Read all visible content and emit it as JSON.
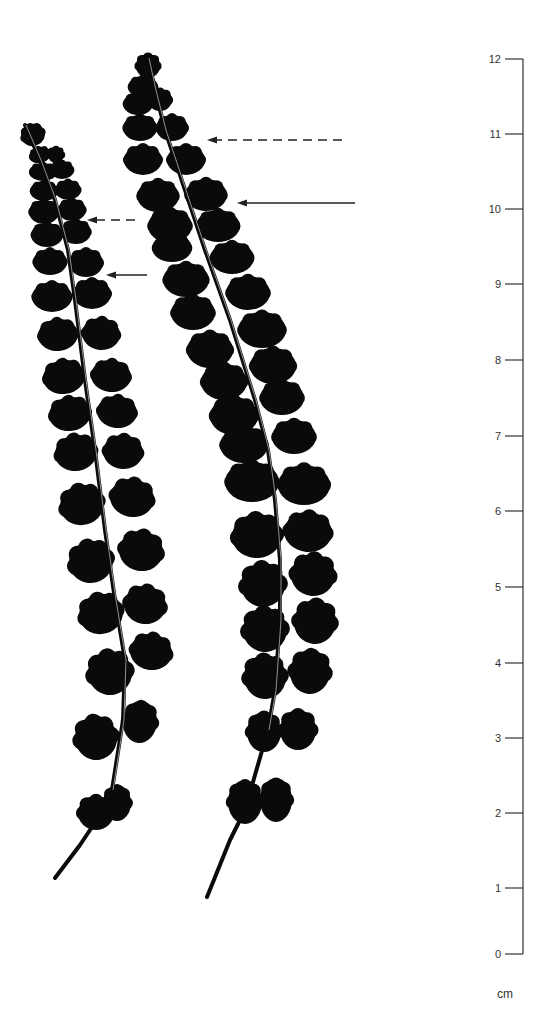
{
  "figure": {
    "background": "#ffffff",
    "ink_color": "#0a0a0a"
  },
  "scale": {
    "unit": "cm",
    "line_x": 523,
    "tick_length": 12,
    "color": "#333333",
    "ticks": [
      {
        "value": "12",
        "y": 59
      },
      {
        "value": "11",
        "y": 134
      },
      {
        "value": "10",
        "y": 209
      },
      {
        "value": "9",
        "y": 284
      },
      {
        "value": "8",
        "y": 360
      },
      {
        "value": "7",
        "y": 436
      },
      {
        "value": "6",
        "y": 511
      },
      {
        "value": "5",
        "y": 587
      },
      {
        "value": "4",
        "y": 663
      },
      {
        "value": "3",
        "y": 738
      },
      {
        "value": "2",
        "y": 813
      },
      {
        "value": "1",
        "y": 888
      },
      {
        "value": "0",
        "y": 954
      }
    ],
    "unit_label_pos": {
      "x": 497,
      "y": 998
    }
  },
  "arrows": [
    {
      "id": "left-fern-dashed",
      "style": "dashed",
      "x1": 135,
      "x2": 87,
      "y": 220
    },
    {
      "id": "left-fern-solid",
      "style": "solid",
      "x1": 147,
      "x2": 106,
      "y": 275
    },
    {
      "id": "right-fern-dashed",
      "style": "dashed",
      "x1": 342,
      "x2": 207,
      "y": 140
    },
    {
      "id": "right-fern-solid",
      "style": "solid",
      "x1": 355,
      "x2": 237,
      "y": 203
    }
  ],
  "ferns": [
    {
      "id": "left-fern",
      "rachis": [
        [
          25,
          125
        ],
        [
          40,
          160
        ],
        [
          55,
          200
        ],
        [
          68,
          250
        ],
        [
          75,
          300
        ],
        [
          85,
          380
        ],
        [
          95,
          450
        ],
        [
          105,
          530
        ],
        [
          115,
          600
        ],
        [
          125,
          660
        ],
        [
          123,
          720
        ],
        [
          112,
          790
        ],
        [
          100,
          815
        ],
        [
          80,
          845
        ],
        [
          55,
          878
        ]
      ],
      "rachis_width": 4,
      "pinnae": [
        {
          "cx": 33,
          "cy": 135,
          "rx": 12,
          "ry": 11,
          "rot": -20
        },
        {
          "cx": 40,
          "cy": 155,
          "rx": 11,
          "ry": 8,
          "rot": -15
        },
        {
          "cx": 56,
          "cy": 155,
          "rx": 8,
          "ry": 8,
          "rot": 0
        },
        {
          "cx": 43,
          "cy": 172,
          "rx": 14,
          "ry": 9,
          "rot": 0
        },
        {
          "cx": 62,
          "cy": 170,
          "rx": 12,
          "ry": 9,
          "rot": 0
        },
        {
          "cx": 44,
          "cy": 191,
          "rx": 14,
          "ry": 10,
          "rot": 0
        },
        {
          "cx": 68,
          "cy": 190,
          "rx": 13,
          "ry": 10,
          "rot": 0
        },
        {
          "cx": 44,
          "cy": 212,
          "rx": 15,
          "ry": 12,
          "rot": 0
        },
        {
          "cx": 72,
          "cy": 210,
          "rx": 14,
          "ry": 11,
          "rot": 0
        },
        {
          "cx": 47,
          "cy": 235,
          "rx": 16,
          "ry": 12,
          "rot": 0
        },
        {
          "cx": 76,
          "cy": 232,
          "rx": 15,
          "ry": 12,
          "rot": 0
        },
        {
          "cx": 50,
          "cy": 262,
          "rx": 17,
          "ry": 13,
          "rot": 0
        },
        {
          "cx": 86,
          "cy": 263,
          "rx": 17,
          "ry": 14,
          "rot": 0
        },
        {
          "cx": 52,
          "cy": 297,
          "rx": 20,
          "ry": 15,
          "rot": 0
        },
        {
          "cx": 92,
          "cy": 294,
          "rx": 19,
          "ry": 15,
          "rot": 0
        },
        {
          "cx": 58,
          "cy": 335,
          "rx": 20,
          "ry": 16,
          "rot": -5
        },
        {
          "cx": 101,
          "cy": 334,
          "rx": 19,
          "ry": 16,
          "rot": 5
        },
        {
          "cx": 64,
          "cy": 377,
          "rx": 21,
          "ry": 17,
          "rot": -8
        },
        {
          "cx": 111,
          "cy": 376,
          "rx": 20,
          "ry": 16,
          "rot": 5
        },
        {
          "cx": 70,
          "cy": 414,
          "rx": 21,
          "ry": 17,
          "rot": -8
        },
        {
          "cx": 117,
          "cy": 412,
          "rx": 20,
          "ry": 16,
          "rot": 5
        },
        {
          "cx": 76,
          "cy": 453,
          "rx": 21,
          "ry": 18,
          "rot": -10
        },
        {
          "cx": 123,
          "cy": 452,
          "rx": 20,
          "ry": 17,
          "rot": 5
        },
        {
          "cx": 82,
          "cy": 505,
          "rx": 22,
          "ry": 20,
          "rot": -15
        },
        {
          "cx": 132,
          "cy": 498,
          "rx": 22,
          "ry": 19,
          "rot": 10
        },
        {
          "cx": 91,
          "cy": 562,
          "rx": 22,
          "ry": 21,
          "rot": -15
        },
        {
          "cx": 141,
          "cy": 551,
          "rx": 22,
          "ry": 20,
          "rot": 10
        },
        {
          "cx": 101,
          "cy": 614,
          "rx": 22,
          "ry": 20,
          "rot": -15
        },
        {
          "cx": 145,
          "cy": 605,
          "rx": 21,
          "ry": 19,
          "rot": 10
        },
        {
          "cx": 110,
          "cy": 673,
          "rx": 22,
          "ry": 22,
          "rot": -10
        },
        {
          "cx": 151,
          "cy": 652,
          "rx": 21,
          "ry": 18,
          "rot": 10
        },
        {
          "cx": 96,
          "cy": 738,
          "rx": 21,
          "ry": 22,
          "rot": -10
        },
        {
          "cx": 140,
          "cy": 722,
          "rx": 17,
          "ry": 21,
          "rot": 5
        },
        {
          "cx": 96,
          "cy": 813,
          "rx": 18,
          "ry": 17,
          "rot": 0
        },
        {
          "cx": 117,
          "cy": 803,
          "rx": 14,
          "ry": 18,
          "rot": 0
        }
      ]
    },
    {
      "id": "right-fern",
      "rachis": [
        [
          148,
          58
        ],
        [
          155,
          90
        ],
        [
          165,
          130
        ],
        [
          180,
          175
        ],
        [
          205,
          250
        ],
        [
          230,
          320
        ],
        [
          255,
          400
        ],
        [
          268,
          450
        ],
        [
          275,
          500
        ],
        [
          280,
          560
        ],
        [
          280,
          620
        ],
        [
          275,
          690
        ],
        [
          268,
          730
        ],
        [
          255,
          775
        ],
        [
          245,
          810
        ],
        [
          230,
          840
        ],
        [
          207,
          897
        ]
      ],
      "rachis_width": 4,
      "pinnae": [
        {
          "cx": 148,
          "cy": 66,
          "rx": 12,
          "ry": 12,
          "rot": 0
        },
        {
          "cx": 143,
          "cy": 87,
          "rx": 15,
          "ry": 11,
          "rot": 0
        },
        {
          "cx": 138,
          "cy": 104,
          "rx": 15,
          "ry": 11,
          "rot": 0
        },
        {
          "cx": 160,
          "cy": 100,
          "rx": 12,
          "ry": 11,
          "rot": 0
        },
        {
          "cx": 140,
          "cy": 128,
          "rx": 17,
          "ry": 13,
          "rot": 0
        },
        {
          "cx": 172,
          "cy": 128,
          "rx": 16,
          "ry": 13,
          "rot": 0
        },
        {
          "cx": 143,
          "cy": 160,
          "rx": 19,
          "ry": 15,
          "rot": 0
        },
        {
          "cx": 186,
          "cy": 160,
          "rx": 19,
          "ry": 15,
          "rot": 0
        },
        {
          "cx": 158,
          "cy": 196,
          "rx": 21,
          "ry": 16,
          "rot": 0
        },
        {
          "cx": 206,
          "cy": 195,
          "rx": 21,
          "ry": 16,
          "rot": 0
        },
        {
          "cx": 170,
          "cy": 226,
          "rx": 22,
          "ry": 17,
          "rot": 0
        },
        {
          "cx": 218,
          "cy": 226,
          "rx": 22,
          "ry": 16,
          "rot": 0
        },
        {
          "cx": 172,
          "cy": 248,
          "rx": 20,
          "ry": 14,
          "rot": 0
        },
        {
          "cx": 232,
          "cy": 258,
          "rx": 22,
          "ry": 16,
          "rot": 0
        },
        {
          "cx": 186,
          "cy": 280,
          "rx": 23,
          "ry": 17,
          "rot": 0
        },
        {
          "cx": 248,
          "cy": 293,
          "rx": 22,
          "ry": 17,
          "rot": 0
        },
        {
          "cx": 193,
          "cy": 313,
          "rx": 22,
          "ry": 17,
          "rot": 0
        },
        {
          "cx": 262,
          "cy": 330,
          "rx": 24,
          "ry": 18,
          "rot": 0
        },
        {
          "cx": 210,
          "cy": 350,
          "rx": 23,
          "ry": 18,
          "rot": 0
        },
        {
          "cx": 273,
          "cy": 366,
          "rx": 23,
          "ry": 18,
          "rot": 0
        },
        {
          "cx": 224,
          "cy": 382,
          "rx": 23,
          "ry": 18,
          "rot": 0
        },
        {
          "cx": 282,
          "cy": 398,
          "rx": 22,
          "ry": 17,
          "rot": 0
        },
        {
          "cx": 234,
          "cy": 416,
          "rx": 24,
          "ry": 19,
          "rot": 0
        },
        {
          "cx": 244,
          "cy": 445,
          "rx": 24,
          "ry": 18,
          "rot": 0
        },
        {
          "cx": 294,
          "cy": 437,
          "rx": 22,
          "ry": 17,
          "rot": 0
        },
        {
          "cx": 252,
          "cy": 482,
          "rx": 27,
          "ry": 20,
          "rot": 0
        },
        {
          "cx": 304,
          "cy": 485,
          "rx": 26,
          "ry": 20,
          "rot": 0
        },
        {
          "cx": 257,
          "cy": 536,
          "rx": 25,
          "ry": 22,
          "rot": -5
        },
        {
          "cx": 308,
          "cy": 532,
          "rx": 24,
          "ry": 20,
          "rot": 5
        },
        {
          "cx": 263,
          "cy": 585,
          "rx": 22,
          "ry": 22,
          "rot": -5
        },
        {
          "cx": 313,
          "cy": 575,
          "rx": 22,
          "ry": 21,
          "rot": 5
        },
        {
          "cx": 265,
          "cy": 630,
          "rx": 22,
          "ry": 22,
          "rot": -5
        },
        {
          "cx": 315,
          "cy": 622,
          "rx": 21,
          "ry": 22,
          "rot": 5
        },
        {
          "cx": 265,
          "cy": 677,
          "rx": 21,
          "ry": 22,
          "rot": -5
        },
        {
          "cx": 310,
          "cy": 672,
          "rx": 20,
          "ry": 22,
          "rot": 5
        },
        {
          "cx": 264,
          "cy": 732,
          "rx": 17,
          "ry": 20,
          "rot": 0
        },
        {
          "cx": 298,
          "cy": 730,
          "rx": 18,
          "ry": 20,
          "rot": 0
        },
        {
          "cx": 245,
          "cy": 802,
          "rx": 17,
          "ry": 22,
          "rot": 0
        },
        {
          "cx": 276,
          "cy": 800,
          "rx": 16,
          "ry": 22,
          "rot": 0
        }
      ]
    }
  ]
}
